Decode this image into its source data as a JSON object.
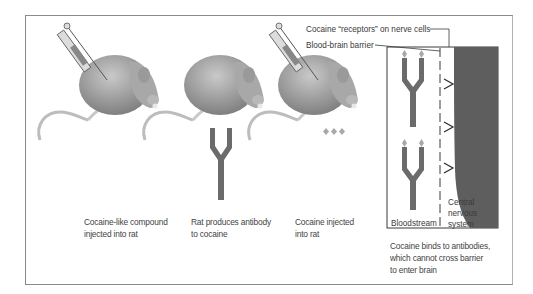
{
  "figure": {
    "panels": [
      {
        "caption_line1": "Cocaine-like compound",
        "caption_line2": "injected into rat"
      },
      {
        "caption_line1": "Rat produces antibody",
        "caption_line2": "to cocaine"
      },
      {
        "caption_line1": "Cocaine injected",
        "caption_line2": "into rat"
      }
    ],
    "inset": {
      "label_receptors": "Cocaine “receptors” on nerve cells",
      "label_barrier": "Blood-brain barrier",
      "label_bloodstream": "Bloodstream",
      "label_cns_line1": "Central",
      "label_cns_line2": "nervous",
      "label_cns_line3": "system",
      "caption_line1": "Cocaine binds to antibodies,",
      "caption_line2": "which cannot cross barrier",
      "caption_line3": "to enter brain"
    },
    "colors": {
      "antibody": "#6b6b6b",
      "cns": "#5e5e5e",
      "cocaine": "#a8a8a8",
      "frame": "#8a8a8a"
    }
  }
}
